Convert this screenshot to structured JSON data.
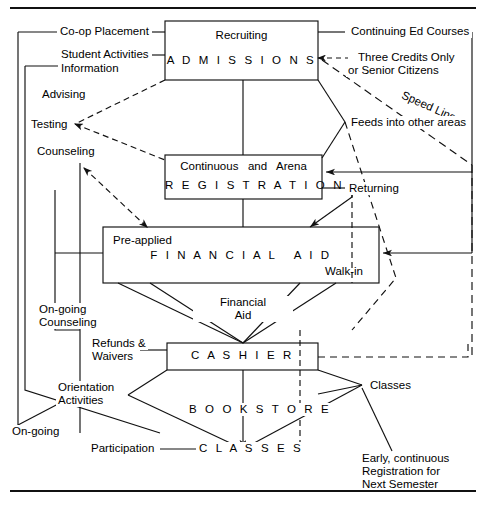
{
  "diagram": {
    "title_rules": {
      "top": true,
      "bottom": true
    },
    "boxes": [
      {
        "id": "admissions",
        "line1": "Recruiting",
        "line2": "A D M I S S I O N S"
      },
      {
        "id": "registration",
        "line1": "Continuous   and   Arena",
        "line2": "R E G I S T R A T I O N"
      },
      {
        "id": "financial_aid",
        "line1": "Pre-applied",
        "line2": "F I N A N C I A L   A I D",
        "line3": "Walk-in"
      },
      {
        "id": "cashier",
        "line1": "C A S H I E R"
      }
    ],
    "nodes": [
      {
        "id": "bookstore",
        "label": "B O O K S T O R E"
      },
      {
        "id": "classes_node",
        "label": "C L A S S E S"
      }
    ],
    "labels": {
      "coop_placement": "Co-op Placement",
      "student_activities": "Student Activities",
      "information": "Information",
      "advising": "Advising",
      "testing": "Testing",
      "counseling": "Counseling",
      "ongoing_counseling_l1": "On-going",
      "ongoing_counseling_l2": "Counseling",
      "orientation_l1": "Orientation",
      "orientation_l2": "Activities",
      "ongoing": "On-going",
      "participation": "Participation",
      "refunds_l1": "Refunds &",
      "refunds_l2": "Waivers",
      "financial_aid_flow_l1": "Financial",
      "financial_aid_flow_l2": "Aid",
      "continuing_ed": "Continuing Ed Courses",
      "three_credits_l1": "Three Credits Only",
      "three_credits_l2": "or Senior Citizens",
      "speed_line": "Speed Line",
      "feeds_into": "Feeds into other areas",
      "returning": "Returning",
      "classes_right": "Classes",
      "early_l1": "Early, continuous",
      "early_l2": "Registration for",
      "early_l3": "Next Semester"
    },
    "style": {
      "stroke": "#111111",
      "background": "#ffffff"
    }
  }
}
